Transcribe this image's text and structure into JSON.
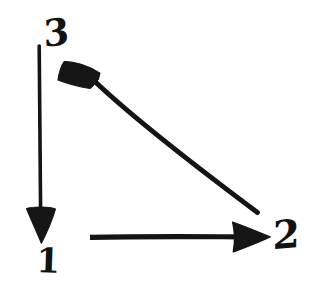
{
  "figure": {
    "kind": "hand-drawn-diagram",
    "background_color": "#ffffff",
    "ink_color": "#141414",
    "canvas": {
      "width": 315,
      "height": 282
    }
  },
  "nodes": [
    {
      "id": "1",
      "label": "1",
      "x": 43,
      "y": 259
    },
    {
      "id": "2",
      "label": "2",
      "x": 286,
      "y": 238
    },
    {
      "id": "3",
      "label": "3",
      "x": 54,
      "y": 34
    }
  ],
  "arrows": [
    {
      "id": "arrow-3-to-1",
      "label": "vertical down arrow",
      "from": "3",
      "to": "1",
      "direction": "down",
      "start": {
        "x": 39,
        "y": 47
      },
      "end": {
        "x": 41,
        "y": 243
      },
      "stroke_width": 4,
      "head": "solid-triangle"
    },
    {
      "id": "arrow-1-to-2",
      "label": "horizontal right arrow",
      "from": "1",
      "to": "2",
      "direction": "right",
      "start": {
        "x": 90,
        "y": 237
      },
      "end": {
        "x": 270,
        "y": 237
      },
      "stroke_width": 5,
      "head": "solid-triangle"
    },
    {
      "id": "arrow-2-to-3",
      "label": "diagonal up-left arrow",
      "from": "2",
      "to": "3",
      "direction": "up-left",
      "start": {
        "x": 257,
        "y": 212
      },
      "end": {
        "x": 64,
        "y": 62
      },
      "stroke_width": 5,
      "head": "solid-triangle"
    }
  ]
}
